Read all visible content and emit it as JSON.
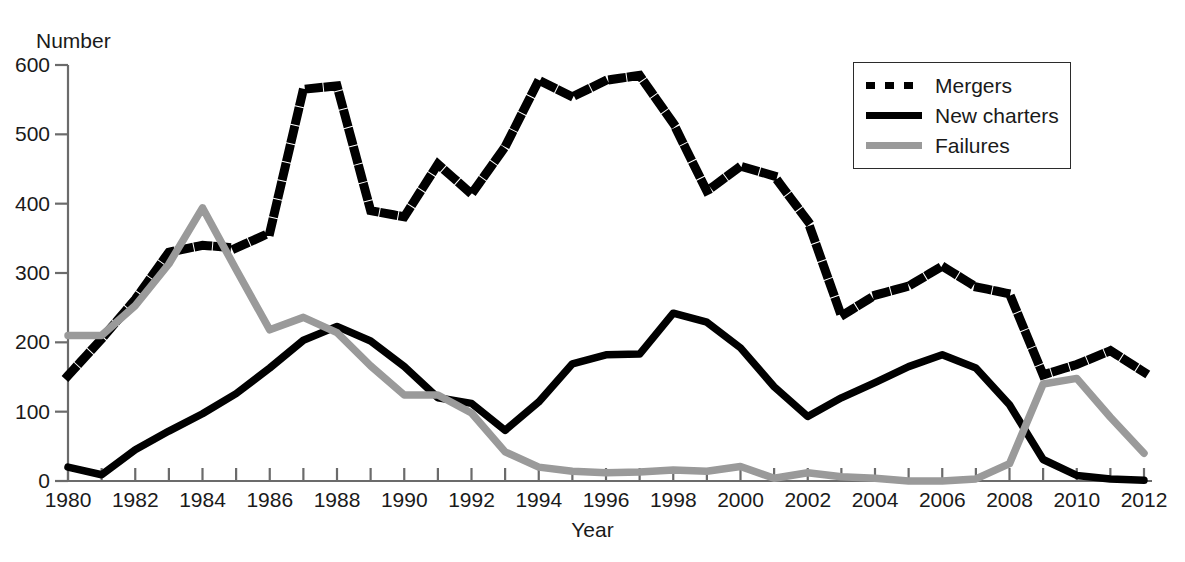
{
  "chart_data": {
    "type": "line",
    "title": "",
    "xlabel": "Year",
    "ylabel": "Number",
    "xlim": [
      1980,
      2012
    ],
    "ylim": [
      0,
      600
    ],
    "grid": false,
    "legend_position": "top-right",
    "x": [
      1980,
      1981,
      1982,
      1983,
      1984,
      1985,
      1986,
      1987,
      1988,
      1989,
      1990,
      1991,
      1992,
      1993,
      1994,
      1995,
      1996,
      1997,
      1998,
      1999,
      2000,
      2001,
      2002,
      2003,
      2004,
      2005,
      2006,
      2007,
      2008,
      2009,
      2010,
      2011,
      2012
    ],
    "xticklabels": [
      "1980",
      "",
      "1982",
      "",
      "1984",
      "",
      "1986",
      "",
      "1988",
      "",
      "1990",
      "",
      "1992",
      "",
      "1994",
      "",
      "1996",
      "",
      "1998",
      "",
      "2000",
      "",
      "2002",
      "",
      "2004",
      "",
      "2006",
      "",
      "2008",
      "",
      "2010",
      "",
      "2012"
    ],
    "yticks": [
      0,
      100,
      200,
      300,
      400,
      500,
      600
    ],
    "yticklabels": [
      "0",
      "100",
      "200",
      "300",
      "400",
      "500",
      "600"
    ],
    "series": [
      {
        "name": "Mergers",
        "style": "dotted",
        "color": "#000000",
        "values": [
          152,
          205,
          262,
          330,
          340,
          336,
          358,
          565,
          570,
          390,
          381,
          457,
          414,
          482,
          578,
          554,
          578,
          585,
          516,
          418,
          454,
          440,
          375,
          238,
          268,
          281,
          310,
          280,
          270,
          153,
          168,
          188,
          157
        ]
      },
      {
        "name": "New charters",
        "style": "solid",
        "color": "#000000",
        "values": [
          20,
          9,
          45,
          72,
          97,
          126,
          163,
          203,
          223,
          202,
          165,
          120,
          112,
          73,
          114,
          169,
          182,
          183,
          242,
          229,
          192,
          136,
          93,
          120,
          142,
          165,
          182,
          163,
          110,
          31,
          8,
          3,
          1
        ]
      },
      {
        "name": "Failures",
        "style": "solid",
        "color": "#9a9a9a",
        "values": [
          210,
          210,
          253,
          313,
          394,
          305,
          218,
          236,
          214,
          166,
          124,
          124,
          98,
          42,
          20,
          14,
          12,
          13,
          16,
          14,
          21,
          4,
          12,
          6,
          4,
          0,
          0,
          3,
          25,
          140,
          148,
          92,
          40
        ]
      }
    ]
  },
  "legend": {
    "items": [
      {
        "label": "Mergers",
        "swatch": "dashed-black-swatch"
      },
      {
        "label": "New charters",
        "swatch": "solid-black-swatch"
      },
      {
        "label": "Failures",
        "swatch": "solid-gray-swatch"
      }
    ]
  },
  "colors": {
    "mergers": "#000000",
    "new_charters": "#000000",
    "failures": "#9a9a9a",
    "axis": "#6b6b6b",
    "text": "#1a1a1a",
    "background": "#ffffff"
  }
}
